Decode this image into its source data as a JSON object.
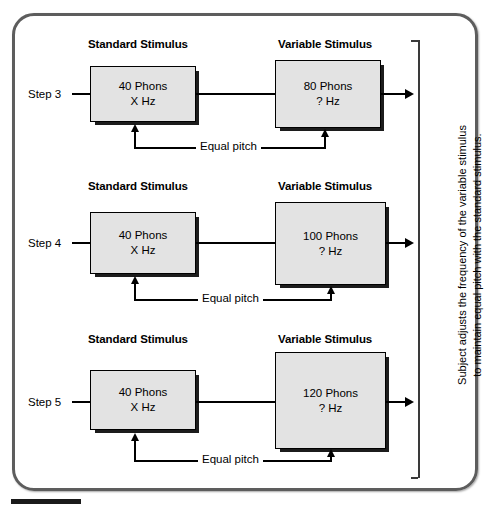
{
  "figure": {
    "headings": {
      "standard": "Standard Stimulus",
      "variable": "Variable Stimulus"
    },
    "equal_pitch_label": "Equal pitch",
    "side_caption_line1": "Subject adjusts the frequency of the variable stimulus",
    "side_caption_line2": "to maintain equal pitch with the standard stimulus.",
    "colors": {
      "box_fill": "#e3e3e3",
      "box_border": "#000000",
      "box_shadow": "#1c1c1c",
      "frame_border": "#5d5d5d",
      "rule": "#1a1a1a",
      "text": "#000000"
    },
    "steps": [
      {
        "step_label": "Step 3",
        "standard": {
          "level": "40 Phons",
          "frequency": "X Hz"
        },
        "variable": {
          "level": "80 Phons",
          "frequency": "? Hz"
        }
      },
      {
        "step_label": "Step 4",
        "standard": {
          "level": "40 Phons",
          "frequency": "X Hz"
        },
        "variable": {
          "level": "100 Phons",
          "frequency": "? Hz"
        }
      },
      {
        "step_label": "Step 5",
        "standard": {
          "level": "40 Phons",
          "frequency": "X Hz"
        },
        "variable": {
          "level": "120 Phons",
          "frequency": "? Hz"
        }
      }
    ]
  }
}
